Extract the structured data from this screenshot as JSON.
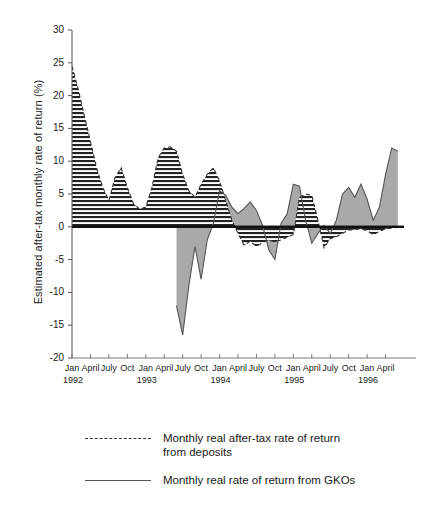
{
  "chart_data": {
    "type": "area",
    "title": "",
    "subtitle": "",
    "xlabel": "",
    "ylabel": "Estimated after-tax monthly rate of return (%)",
    "ylim": [
      -20,
      30
    ],
    "yticks": [
      30,
      25,
      20,
      15,
      10,
      5,
      0,
      -5,
      -10,
      -15,
      -20
    ],
    "ytick_labels": [
      "30",
      "25",
      "20",
      "15",
      "10",
      "5",
      "0",
      "-5",
      "-10",
      "-15",
      "-20"
    ],
    "grid": false,
    "legend_position": "bottom",
    "x_axis": {
      "range": [
        "1992-01",
        "1996-07"
      ],
      "tick_interval_months": 3,
      "tick_months": [
        "Jan",
        "April",
        "July",
        "Oct"
      ],
      "years": [
        "1992",
        "1993",
        "1994",
        "1995",
        "1996"
      ],
      "tick_labels": [
        "Jan",
        "April",
        "July",
        "Oct",
        "Jan",
        "April",
        "July",
        "Oct",
        "Jan",
        "April",
        "July",
        "Oct",
        "Jan",
        "April",
        "July",
        "Oct",
        "Jan",
        "April"
      ],
      "year_labels": [
        "1992",
        "1993",
        "1994",
        "1995",
        "1996"
      ]
    },
    "series": [
      {
        "name": "Monthly real after-tax rate of return from deposits",
        "style": "dashed-line-with-hatched-fill",
        "fill": "horizontal-hatch",
        "line_color": "#333333",
        "x": [
          "1992-01",
          "1992-02",
          "1992-03",
          "1992-04",
          "1992-05",
          "1992-06",
          "1992-07",
          "1992-08",
          "1992-09",
          "1992-10",
          "1992-11",
          "1992-12",
          "1993-01",
          "1993-02",
          "1993-03",
          "1993-04",
          "1993-05",
          "1993-06",
          "1993-07",
          "1993-08",
          "1993-09",
          "1993-10",
          "1993-11",
          "1993-12",
          "1994-01",
          "1994-02",
          "1994-03",
          "1994-04",
          "1994-05",
          "1994-06",
          "1994-07",
          "1994-08",
          "1994-09",
          "1994-10",
          "1994-11",
          "1994-12",
          "1995-01",
          "1995-02",
          "1995-03",
          "1995-04",
          "1995-05",
          "1995-06",
          "1995-07",
          "1995-08",
          "1995-09",
          "1995-10",
          "1995-11",
          "1995-12",
          "1996-01",
          "1996-02",
          "1996-03",
          "1996-04",
          "1996-05",
          "1996-06"
        ],
        "values": [
          24.5,
          21.0,
          17.0,
          13.0,
          9.0,
          6.0,
          4.0,
          7.5,
          9.0,
          6.0,
          3.5,
          2.7,
          3.0,
          6.0,
          10.5,
          12.0,
          12.2,
          11.5,
          8.0,
          5.5,
          4.5,
          6.5,
          8.0,
          9.0,
          7.0,
          4.0,
          1.0,
          -1.0,
          -2.8,
          -2.2,
          -3.0,
          -2.4,
          -2.0,
          -2.3,
          -2.0,
          -1.6,
          -1.2,
          4.5,
          5.0,
          4.8,
          1.0,
          -3.2,
          -1.8,
          -1.5,
          -1.0,
          -0.5,
          -0.4,
          -0.3,
          -0.6,
          -1.2,
          -0.7,
          -0.3,
          -0.2,
          -0.1
        ]
      },
      {
        "name": "Monthly real rate of return from GKOs",
        "style": "solid-line-with-gray-fill",
        "fill": "#a9a9a9",
        "line_color": "#555555",
        "x": [
          "1993-06",
          "1993-07",
          "1993-08",
          "1993-09",
          "1993-10",
          "1993-11",
          "1993-12",
          "1994-01",
          "1994-02",
          "1994-03",
          "1994-04",
          "1994-05",
          "1994-06",
          "1994-07",
          "1994-08",
          "1994-09",
          "1994-10",
          "1994-11",
          "1994-12",
          "1995-01",
          "1995-02",
          "1995-03",
          "1995-04",
          "1995-05",
          "1995-06",
          "1995-07",
          "1995-08",
          "1995-09",
          "1995-10",
          "1995-11",
          "1995-12",
          "1996-01",
          "1996-02",
          "1996-03",
          "1996-04",
          "1996-05",
          "1996-06"
        ],
        "values": [
          -12.0,
          -16.5,
          -9.0,
          -3.0,
          -8.0,
          -2.0,
          0.5,
          5.5,
          4.8,
          3.0,
          2.0,
          2.8,
          3.8,
          2.5,
          0.2,
          -3.5,
          -5.0,
          0.5,
          2.0,
          6.5,
          6.2,
          1.0,
          -2.5,
          -1.0,
          0.2,
          -1.0,
          1.0,
          5.0,
          6.0,
          4.5,
          6.5,
          4.2,
          1.0,
          3.0,
          8.0,
          12.0,
          11.5
        ]
      }
    ],
    "legend": [
      {
        "label": "Monthly real after-tax rate of return\nfrom deposits",
        "style": "dashed"
      },
      {
        "label": "Monthly real rate of return from GKOs",
        "style": "solid"
      }
    ]
  }
}
